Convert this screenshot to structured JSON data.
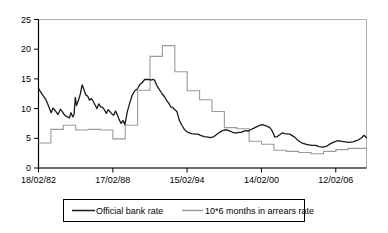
{
  "chart_data": {
    "type": "line",
    "title": "",
    "subtitle": "",
    "xlabel": "",
    "ylabel": "",
    "xlim": [
      1982.13,
      2008.6
    ],
    "ylim": [
      0,
      25
    ],
    "grid": false,
    "legend_position": "bottom",
    "yticks": [
      0,
      5,
      10,
      15,
      20,
      25
    ],
    "ytick_labels": [
      "0",
      "5",
      "10",
      "15",
      "20",
      "25"
    ],
    "xticks": [
      1982.13,
      1988.13,
      1994.12,
      2000.12,
      2006.12
    ],
    "xtick_labels": [
      "18/02/82",
      "17/02/88",
      "15/02/94",
      "14/02/00",
      "12/02/06"
    ],
    "series": [
      {
        "name": "Official bank rate",
        "color": "#1a1a1a",
        "x": [
          1982.13,
          1982.3,
          1982.5,
          1982.7,
          1982.85,
          1983.0,
          1983.15,
          1983.3,
          1983.5,
          1983.7,
          1983.9,
          1984.05,
          1984.2,
          1984.35,
          1984.5,
          1984.62,
          1984.75,
          1984.9,
          1985.0,
          1985.1,
          1985.2,
          1985.35,
          1985.5,
          1985.65,
          1985.8,
          1985.95,
          1986.1,
          1986.25,
          1986.4,
          1986.55,
          1986.7,
          1986.85,
          1987.0,
          1987.15,
          1987.3,
          1987.45,
          1987.6,
          1987.75,
          1987.9,
          1988.05,
          1988.2,
          1988.35,
          1988.5,
          1988.65,
          1988.8,
          1988.95,
          1989.1,
          1989.3,
          1989.5,
          1989.7,
          1989.9,
          1990.1,
          1990.3,
          1990.5,
          1990.7,
          1990.9,
          1991.05,
          1991.2,
          1991.35,
          1991.5,
          1991.65,
          1991.8,
          1991.95,
          1992.1,
          1992.3,
          1992.5,
          1992.7,
          1992.8,
          1992.95,
          1993.1,
          1993.3,
          1993.5,
          1993.7,
          1993.9,
          1994.1,
          1994.3,
          1994.5,
          1994.8,
          1995.0,
          1995.2,
          1995.5,
          1995.8,
          1996.0,
          1996.3,
          1996.6,
          1996.9,
          1997.1,
          1997.3,
          1997.5,
          1997.7,
          1997.9,
          1998.1,
          1998.3,
          1998.5,
          1998.7,
          1998.9,
          1999.05,
          1999.2,
          1999.4,
          1999.6,
          1999.8,
          2000.0,
          2000.2,
          2000.5,
          2000.8,
          2001.0,
          2001.2,
          2001.4,
          2001.6,
          2001.8,
          2002.0,
          2002.4,
          2002.8,
          2003.1,
          2003.4,
          2003.7,
          2003.95,
          2004.2,
          2004.5,
          2004.8,
          2005.1,
          2005.4,
          2005.7,
          2006.0,
          2006.3,
          2006.6,
          2006.9,
          2007.2,
          2007.5,
          2007.8,
          2008.0,
          2008.2,
          2008.4,
          2008.6
        ],
        "y": [
          13.4,
          12.8,
          12.2,
          11.6,
          10.9,
          10.1,
          9.3,
          10.1,
          9.6,
          9.0,
          9.9,
          9.5,
          9.0,
          8.7,
          8.6,
          8.4,
          9.3,
          8.6,
          9.0,
          11.9,
          10.5,
          11.4,
          12.4,
          14.0,
          13.2,
          12.3,
          12.1,
          11.4,
          11.7,
          11.2,
          10.6,
          10.0,
          10.8,
          10.3,
          10.2,
          9.8,
          9.2,
          9.8,
          9.5,
          9.1,
          8.9,
          9.6,
          8.9,
          8.1,
          7.5,
          8.0,
          7.3,
          9.5,
          11.0,
          12.3,
          13.0,
          13.3,
          14.0,
          14.4,
          14.9,
          14.9,
          14.9,
          14.8,
          14.9,
          14.8,
          14.0,
          13.5,
          13.0,
          12.5,
          12.0,
          11.3,
          10.7,
          10.3,
          10.2,
          9.9,
          9.5,
          8.0,
          7.2,
          6.5,
          6.1,
          5.9,
          5.8,
          5.7,
          5.7,
          5.5,
          5.3,
          5.2,
          5.1,
          5.3,
          5.8,
          6.2,
          6.4,
          6.4,
          6.3,
          6.1,
          5.9,
          5.9,
          6.0,
          6.0,
          6.2,
          6.3,
          6.2,
          6.4,
          6.6,
          6.8,
          7.0,
          7.2,
          7.3,
          7.1,
          6.8,
          6.2,
          5.2,
          5.3,
          5.6,
          5.9,
          5.8,
          5.7,
          5.2,
          4.6,
          4.2,
          4.0,
          3.9,
          3.8,
          3.8,
          3.6,
          3.5,
          3.7,
          4.1,
          4.4,
          4.6,
          4.5,
          4.4,
          4.3,
          4.4,
          4.6,
          4.8,
          5.1,
          5.5,
          5.1
        ]
      },
      {
        "name": "10*6 months in arrears rate",
        "color": "#9a9a9a",
        "x": [
          1982.13,
          1983.13,
          1983.13,
          1984.13,
          1984.13,
          1985.13,
          1985.13,
          1986.13,
          1986.13,
          1987.13,
          1987.13,
          1988.13,
          1988.13,
          1989.13,
          1989.13,
          1990.13,
          1990.13,
          1990.63,
          1990.63,
          1991.13,
          1991.13,
          1991.63,
          1991.63,
          1992.13,
          1992.13,
          1992.63,
          1992.63,
          1993.13,
          1993.13,
          1993.63,
          1993.63,
          1994.13,
          1994.13,
          1994.63,
          1994.63,
          1995.13,
          1995.13,
          1995.63,
          1995.63,
          1996.13,
          1996.13,
          1996.63,
          1996.63,
          1997.13,
          1997.13,
          1998.13,
          1998.13,
          1999.13,
          1999.13,
          2000.13,
          2000.13,
          2001.13,
          2001.13,
          2002.13,
          2002.13,
          2003.13,
          2003.13,
          2004.13,
          2004.13,
          2005.13,
          2005.13,
          2006.13,
          2006.13,
          2007.13,
          2007.13,
          2008.6
        ],
        "y": [
          4.2,
          4.2,
          6.5,
          6.5,
          7.2,
          7.2,
          6.4,
          6.4,
          6.5,
          6.5,
          6.4,
          6.4,
          4.9,
          4.9,
          7.2,
          7.2,
          13.1,
          13.1,
          13.1,
          13.1,
          18.8,
          18.8,
          18.8,
          18.8,
          20.6,
          20.6,
          20.6,
          20.6,
          16.2,
          16.2,
          16.2,
          16.2,
          13.0,
          13.0,
          13.0,
          13.0,
          11.5,
          11.5,
          11.5,
          11.5,
          9.5,
          9.5,
          9.5,
          9.5,
          6.8,
          6.8,
          6.6,
          6.6,
          4.5,
          4.5,
          4.0,
          4.0,
          3.0,
          3.0,
          2.8,
          2.8,
          2.6,
          2.6,
          2.4,
          2.4,
          2.8,
          2.8,
          3.1,
          3.1,
          3.3,
          3.3
        ]
      }
    ]
  },
  "legend": {
    "entries": [
      {
        "label": "Official bank rate",
        "color": "#1a1a1a"
      },
      {
        "label": "10*6 months in arrears rate",
        "color": "#9a9a9a"
      }
    ]
  },
  "axes": {
    "y_label_0": "0",
    "y_label_5": "5",
    "y_label_10": "10",
    "y_label_15": "15",
    "y_label_20": "20",
    "y_label_25": "25",
    "x_label_1": "18/02/82",
    "x_label_2": "17/02/88",
    "x_label_3": "15/02/94",
    "x_label_4": "14/02/00",
    "x_label_5": "12/02/06"
  },
  "colors": {
    "series_black": "#1a1a1a",
    "series_gray": "#9a9a9a",
    "axis": "#000000",
    "plot_border": "#b0b0b0",
    "background": "#ffffff"
  }
}
